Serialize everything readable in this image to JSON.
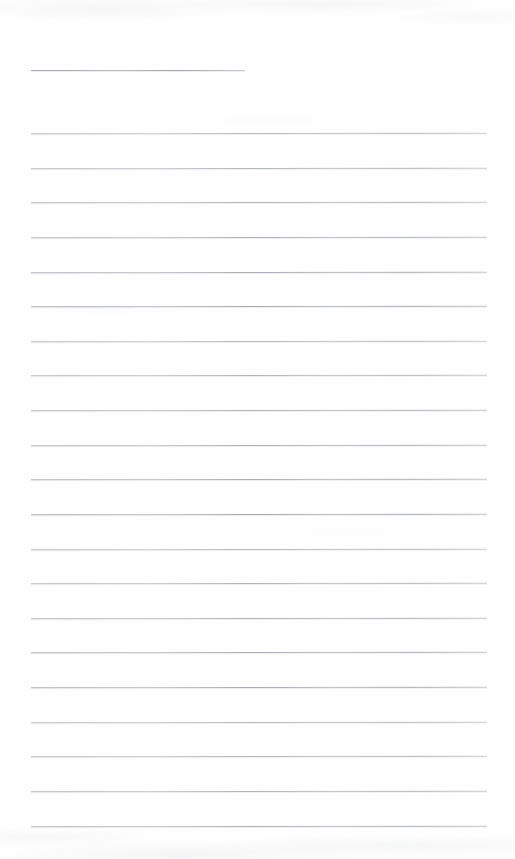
{
  "document": {
    "kind": "scanned-lined-notebook-page",
    "title_text": "",
    "body_text": "",
    "page_width": 515,
    "page_height": 859,
    "background_color": "#fefefe",
    "rule_color": "#a4a8ae",
    "is_blank": true
  },
  "header_rule": {
    "name": "title-rule",
    "x": 31,
    "y": 70,
    "width": 214,
    "content": ""
  },
  "ruled_area": {
    "left": 31,
    "right": 487,
    "width": 456,
    "first_line_y": 133,
    "line_spacing": 34.65,
    "line_count": 21,
    "lines": [
      {
        "index": 1,
        "y": 133,
        "content": ""
      },
      {
        "index": 2,
        "y": 168,
        "content": ""
      },
      {
        "index": 3,
        "y": 202,
        "content": ""
      },
      {
        "index": 4,
        "y": 237,
        "content": ""
      },
      {
        "index": 5,
        "y": 272,
        "content": ""
      },
      {
        "index": 6,
        "y": 306,
        "content": ""
      },
      {
        "index": 7,
        "y": 341,
        "content": ""
      },
      {
        "index": 8,
        "y": 375,
        "content": ""
      },
      {
        "index": 9,
        "y": 410,
        "content": ""
      },
      {
        "index": 10,
        "y": 445,
        "content": ""
      },
      {
        "index": 11,
        "y": 479,
        "content": ""
      },
      {
        "index": 12,
        "y": 514,
        "content": ""
      },
      {
        "index": 13,
        "y": 549,
        "content": ""
      },
      {
        "index": 14,
        "y": 583,
        "content": ""
      },
      {
        "index": 15,
        "y": 618,
        "content": ""
      },
      {
        "index": 16,
        "y": 652,
        "content": ""
      },
      {
        "index": 17,
        "y": 687,
        "content": ""
      },
      {
        "index": 18,
        "y": 722,
        "content": ""
      },
      {
        "index": 19,
        "y": 756,
        "content": ""
      },
      {
        "index": 20,
        "y": 791,
        "content": ""
      },
      {
        "index": 21,
        "y": 826,
        "content": ""
      }
    ]
  }
}
